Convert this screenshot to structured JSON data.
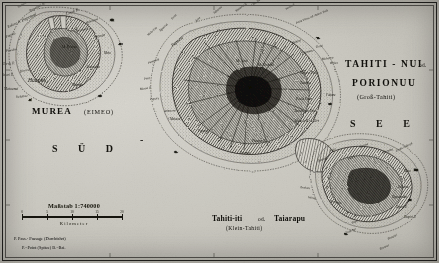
{
  "map": {
    "kind": "antique-engraved-map",
    "language": "German",
    "paper_color": "#cbc9c1",
    "ink_color": "#16150f",
    "titles": {
      "moorea": "MUREA",
      "moorea_alt": "(EIMEO)",
      "tahiti_nui_line1": "TAHITI - NUI",
      "tahiti_nui_od": "od.",
      "tahiti_nui_line2": "PORIONUU",
      "tahiti_nui_sub": "(Groß-Tahiti)",
      "tahiti_iti_line1": "Tahiti-iti",
      "tahiti_iti_od": "od.",
      "tahiti_iti_name": "Taiarapu",
      "tahiti_iti_sub": "(Klein-Tahiti)"
    },
    "ocean_label_left": "S Ü D",
    "ocean_label_dash": "-",
    "ocean_label_right": "S E E"
  },
  "scale": {
    "title": "Maßstab 1:740000",
    "unit_label": "Kilometer",
    "ticks": [
      "0",
      "5",
      "10",
      "15",
      "20"
    ]
  },
  "legend": {
    "line1": "P. Pass.- Passage (Durchfahrt)",
    "line2": "P.=Point (Spitze)  B.=Bai."
  },
  "labels_moorea": [
    {
      "t": "Papetoai B.",
      "x": 30,
      "y": 10,
      "r": -28,
      "c": "ital tiny"
    },
    {
      "t": "Papetoai",
      "x": 22,
      "y": 19,
      "r": -26,
      "c": "ital small"
    },
    {
      "t": "Rakino B.",
      "x": 8,
      "y": 26,
      "r": -24,
      "c": "ital tiny"
    },
    {
      "t": "Cook B.",
      "x": 66,
      "y": 12,
      "r": -18,
      "c": "ital small"
    },
    {
      "t": "Papeto",
      "x": 6,
      "y": 36,
      "r": -22,
      "c": "ital tiny"
    },
    {
      "t": "Pueoha",
      "x": 6,
      "y": 50,
      "r": -10,
      "c": "ital tiny"
    },
    {
      "t": "Tareu P.",
      "x": 3,
      "y": 63,
      "r": -4,
      "c": "ital tiny"
    },
    {
      "t": "Haapiti",
      "x": 28,
      "y": 78,
      "r": 0,
      "c": "ital med"
    },
    {
      "t": "Matoanui",
      "x": 4,
      "y": 88,
      "r": 0,
      "c": "ital tiny"
    },
    {
      "t": "Vaianae",
      "x": 16,
      "y": 96,
      "r": -6,
      "c": "ital tiny"
    },
    {
      "t": "Mt. Tohivea",
      "x": 62,
      "y": 46,
      "r": 0,
      "c": "ital xtiny"
    },
    {
      "t": "Maatea",
      "x": 72,
      "y": 84,
      "r": 0,
      "c": "ital tiny"
    },
    {
      "t": "Afareaitu",
      "x": 86,
      "y": 66,
      "r": 0,
      "c": "ital tiny"
    },
    {
      "t": "Temae",
      "x": 96,
      "y": 36,
      "r": -14,
      "c": "ital tiny"
    },
    {
      "t": "Maharepa",
      "x": 86,
      "y": 22,
      "r": -20,
      "c": "ital xtiny"
    },
    {
      "t": "Mouaputa",
      "x": 76,
      "y": 30,
      "r": -12,
      "c": "ital xtiny"
    },
    {
      "t": "Varari P.",
      "x": 2,
      "y": 74,
      "r": 0,
      "c": "ital xtiny"
    },
    {
      "t": "Motu",
      "x": 104,
      "y": 52,
      "r": 0,
      "c": "ital xtiny"
    },
    {
      "t": "Nuurua",
      "x": 20,
      "y": 70,
      "r": -8,
      "c": "ital xtiny"
    },
    {
      "t": "Tiahura",
      "x": 18,
      "y": 6,
      "r": -30,
      "c": "ital xtiny"
    }
  ],
  "labels_tahitinui": [
    {
      "t": "Motu Uta",
      "x": 148,
      "y": 34,
      "r": -42,
      "c": "ital xtiny"
    },
    {
      "t": "Tipaerui",
      "x": 160,
      "y": 30,
      "r": -44,
      "c": "ital xtiny"
    },
    {
      "t": "Faaa",
      "x": 172,
      "y": 18,
      "r": -48,
      "c": "ital xtiny"
    },
    {
      "t": "Papeete",
      "x": 172,
      "y": 44,
      "r": -38,
      "c": "ital small"
    },
    {
      "t": "Arue",
      "x": 196,
      "y": 20,
      "r": -42,
      "c": "ital xtiny"
    },
    {
      "t": "Taharaa",
      "x": 214,
      "y": 12,
      "r": -40,
      "c": "ital xtiny"
    },
    {
      "t": "Matavai B.",
      "x": 236,
      "y": 10,
      "r": -36,
      "c": "ital xtiny"
    },
    {
      "t": "One Tree Hill",
      "x": 252,
      "y": 4,
      "r": -34,
      "c": "ital xtiny"
    },
    {
      "t": "Venus P.",
      "x": 286,
      "y": 8,
      "r": -30,
      "c": "ital xtiny"
    },
    {
      "t": "Point Venus od. Atimir Tuuk",
      "x": 296,
      "y": 22,
      "r": -22,
      "c": "ital xtiny"
    },
    {
      "t": "Mahina",
      "x": 292,
      "y": 42,
      "r": -18,
      "c": "ital xtiny"
    },
    {
      "t": "Papenoo",
      "x": 302,
      "y": 52,
      "r": -14,
      "c": "ital xtiny"
    },
    {
      "t": "Tiarei",
      "x": 316,
      "y": 46,
      "r": -12,
      "c": "ital xtiny"
    },
    {
      "t": "Hitiaa",
      "x": 330,
      "y": 62,
      "r": -4,
      "c": "ital xtiny"
    },
    {
      "t": "Mahaena",
      "x": 322,
      "y": 58,
      "r": -8,
      "c": "ital xtiny"
    },
    {
      "t": "Faaone",
      "x": 326,
      "y": 94,
      "r": 0,
      "c": "ital xtiny"
    },
    {
      "t": "Mt. Orohena",
      "x": 258,
      "y": 64,
      "r": 0,
      "c": "ital xtiny"
    },
    {
      "t": "Mt. Aorai",
      "x": 236,
      "y": 60,
      "r": 0,
      "c": "ital xtiny"
    },
    {
      "t": "Punaauia",
      "x": 148,
      "y": 62,
      "r": -20,
      "c": "ital xtiny"
    },
    {
      "t": "Paea",
      "x": 144,
      "y": 78,
      "r": -12,
      "c": "ital xtiny"
    },
    {
      "t": "Papara",
      "x": 150,
      "y": 98,
      "r": -6,
      "c": "ital xtiny"
    },
    {
      "t": "Mataiea",
      "x": 170,
      "y": 118,
      "r": 0,
      "c": "ital xtiny"
    },
    {
      "t": "Papeari",
      "x": 198,
      "y": 130,
      "r": 0,
      "c": "ital xtiny"
    },
    {
      "t": "Atimaono",
      "x": 164,
      "y": 110,
      "r": -4,
      "c": "ital xtiny"
    },
    {
      "t": "Maraa P.",
      "x": 140,
      "y": 88,
      "r": -8,
      "c": "ital xtiny"
    },
    {
      "t": "Taravao",
      "x": 240,
      "y": 152,
      "r": 0,
      "c": "ital xtiny"
    },
    {
      "t": "Phaeton H.",
      "x": 252,
      "y": 140,
      "r": 0,
      "c": "ital xtiny"
    },
    {
      "t": "Vaiare Pass.",
      "x": 300,
      "y": 72,
      "r": 0,
      "c": "ital tiny"
    },
    {
      "t": "Taunoa",
      "x": 300,
      "y": 82,
      "r": 0,
      "c": "ital tiny"
    },
    {
      "t": "Paea Pass.",
      "x": 296,
      "y": 98,
      "r": 0,
      "c": "ital tiny"
    },
    {
      "t": "Temarupo Pass.",
      "x": 294,
      "y": 110,
      "r": 0,
      "c": "ital tiny"
    },
    {
      "t": "Ahuroa B. u. Ort",
      "x": 294,
      "y": 120,
      "r": 0,
      "c": "ital tiny"
    }
  ],
  "labels_tahitiiti": [
    {
      "t": "Pueu",
      "x": 330,
      "y": 150,
      "r": -24,
      "c": "ital xtiny"
    },
    {
      "t": "Afaahiti",
      "x": 318,
      "y": 160,
      "r": -20,
      "c": "ital xtiny"
    },
    {
      "t": "Tautira",
      "x": 360,
      "y": 146,
      "r": -22,
      "c": "ital xtiny"
    },
    {
      "t": "Vaitepiha",
      "x": 382,
      "y": 152,
      "r": -20,
      "c": "ital xtiny"
    },
    {
      "t": "Cooks Ankerpl.",
      "x": 396,
      "y": 150,
      "r": -26,
      "c": "ital xtiny"
    },
    {
      "t": "Puuru",
      "x": 348,
      "y": 158,
      "r": -20,
      "c": "ital xtiny"
    },
    {
      "t": "Motu",
      "x": 404,
      "y": 170,
      "r": 0,
      "c": "ital xtiny"
    },
    {
      "t": "Vaitoare",
      "x": 398,
      "y": 186,
      "r": 0,
      "c": "ital xtiny"
    },
    {
      "t": "Teahupoo",
      "x": 330,
      "y": 200,
      "r": 10,
      "c": "ital xtiny"
    },
    {
      "t": "Vairao",
      "x": 308,
      "y": 196,
      "r": 10,
      "c": "ital xtiny"
    },
    {
      "t": "Toahotu",
      "x": 300,
      "y": 186,
      "r": 6,
      "c": "ital xtiny"
    },
    {
      "t": "Tapuaeraha",
      "x": 392,
      "y": 196,
      "r": 0,
      "c": "ital xtiny"
    },
    {
      "t": "Tepari P.",
      "x": 396,
      "y": 206,
      "r": 0,
      "c": "ital xtiny"
    },
    {
      "t": "Taupiri P.",
      "x": 404,
      "y": 216,
      "r": 0,
      "c": "ital xtiny"
    },
    {
      "t": "Tapu",
      "x": 352,
      "y": 222,
      "r": -26,
      "c": "ital xtiny"
    },
    {
      "t": "Orahoge",
      "x": 346,
      "y": 232,
      "r": -24,
      "c": "ital xtiny"
    },
    {
      "t": "Teaupiri",
      "x": 388,
      "y": 238,
      "r": -26,
      "c": "ital xtiny"
    },
    {
      "t": "Teaonui",
      "x": 380,
      "y": 248,
      "r": -24,
      "c": "ital xtiny"
    }
  ]
}
